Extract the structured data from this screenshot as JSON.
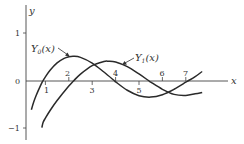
{
  "chart_data": {
    "type": "line",
    "title": "",
    "xlabel": "x",
    "ylabel": "y",
    "xlim": [
      0,
      8.8
    ],
    "ylim": [
      -1.0,
      1.4
    ],
    "grid": false,
    "legend": "inline annotations with arrows",
    "x_ticks": [
      "1",
      "2",
      "3",
      "4",
      "5",
      "6",
      "7"
    ],
    "y_ticks": [
      "1",
      "0",
      "−1"
    ],
    "series": [
      {
        "name": "Y₀(x)",
        "label_main": "Y",
        "label_sub": "0",
        "label_arg": "(x)",
        "points": [
          [
            0.4,
            -0.606
          ],
          [
            0.5,
            -0.444
          ],
          [
            0.6,
            -0.309
          ],
          [
            0.8,
            -0.087
          ],
          [
            0.89,
            0
          ],
          [
            1.0,
            0.088
          ],
          [
            1.2,
            0.228
          ],
          [
            1.5,
            0.382
          ],
          [
            1.8,
            0.478
          ],
          [
            2.0,
            0.51
          ],
          [
            2.2,
            0.521
          ],
          [
            2.5,
            0.498
          ],
          [
            3.0,
            0.377
          ],
          [
            3.5,
            0.189
          ],
          [
            3.96,
            0
          ],
          [
            4.0,
            -0.017
          ],
          [
            4.5,
            -0.195
          ],
          [
            5.0,
            -0.309
          ],
          [
            5.5,
            -0.339
          ],
          [
            6.0,
            -0.288
          ],
          [
            6.5,
            -0.173
          ],
          [
            7.0,
            -0.026
          ],
          [
            7.09,
            0
          ],
          [
            7.4,
            0.09
          ],
          [
            7.7,
            0.2
          ]
        ]
      },
      {
        "name": "Y₁(x)",
        "label_main": "Y",
        "label_sub": "1",
        "label_arg": "(x)",
        "points": [
          [
            0.85,
            -0.98
          ],
          [
            0.9,
            -0.873
          ],
          [
            1.0,
            -0.781
          ],
          [
            1.2,
            -0.621
          ],
          [
            1.5,
            -0.412
          ],
          [
            2.0,
            -0.107
          ],
          [
            2.2,
            0
          ],
          [
            2.5,
            0.146
          ],
          [
            3.0,
            0.325
          ],
          [
            3.5,
            0.41
          ],
          [
            3.7,
            0.416
          ],
          [
            4.0,
            0.398
          ],
          [
            4.5,
            0.301
          ],
          [
            5.0,
            0.148
          ],
          [
            5.43,
            0
          ],
          [
            5.5,
            -0.023
          ],
          [
            6.0,
            -0.175
          ],
          [
            6.5,
            -0.282
          ],
          [
            7.0,
            -0.303
          ],
          [
            7.4,
            -0.27
          ],
          [
            7.7,
            -0.24
          ]
        ]
      }
    ],
    "annotations": [
      {
        "text": "Y₀(x)",
        "arrow_to": [
          2.2,
          0.52
        ]
      },
      {
        "text": "Y₁(x)",
        "arrow_to": [
          3.9,
          0.41
        ]
      }
    ]
  }
}
